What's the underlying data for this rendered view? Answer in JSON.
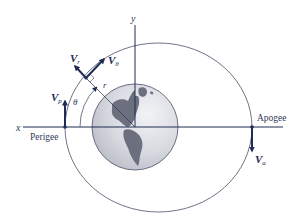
{
  "diagram": {
    "axes": {
      "x_label": "x",
      "y_label": "y"
    },
    "points": {
      "perigee_label": "Perigee",
      "apogee_label": "Apogee"
    },
    "vectors": {
      "vp": {
        "symbol": "V",
        "subscript": "p"
      },
      "va": {
        "symbol": "V",
        "subscript": "a"
      },
      "vr": {
        "symbol": "V",
        "subscript": "r"
      },
      "vtheta": {
        "symbol": "V",
        "subscript": "θ"
      }
    },
    "annotations": {
      "radius": "r",
      "angle": "θ"
    },
    "colors": {
      "axis": "#1f2d55",
      "orbit": "#4a4f66",
      "vector": "#1f2d55",
      "earth_ocean": "#d9dbe2",
      "earth_land": "#6b6f7e"
    }
  }
}
